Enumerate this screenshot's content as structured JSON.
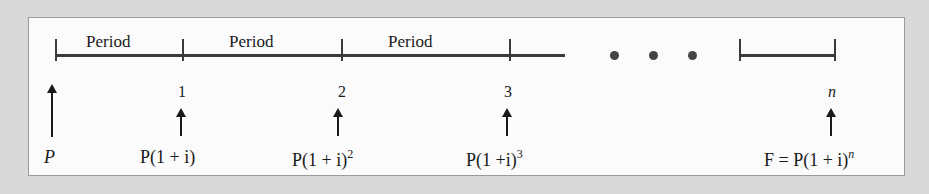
{
  "diagram": {
    "period_label": "Period",
    "period_labels": [
      "Period",
      "Period",
      "Period"
    ],
    "ellipsis": "• • •",
    "points": [
      {
        "index": "0",
        "label": "",
        "value": "P"
      },
      {
        "index": "1",
        "label": "1",
        "value": "P(1 + i)"
      },
      {
        "index": "2",
        "label": "2",
        "value": "P(1 + i)",
        "exponent": "2"
      },
      {
        "index": "3",
        "label": "3",
        "value": "P(1 +i)",
        "exponent": "3"
      },
      {
        "index": "n",
        "label": "n",
        "value": "F = P(1 + i)",
        "exponent": "n"
      }
    ],
    "colors": {
      "background": "#d9d9d9",
      "panel": "#fbfbfb",
      "line": "#3a3a3a",
      "text": "#1a1a1a"
    }
  }
}
